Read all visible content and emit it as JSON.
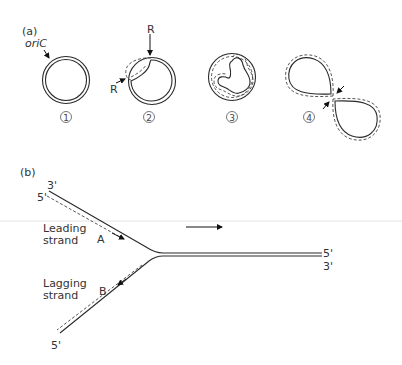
{
  "panel_a": {
    "label": "(a)",
    "origin_label": "oriC",
    "replication_fork_label_top": "R",
    "replication_fork_label_left": "R",
    "stages": [
      {
        "number": "1",
        "description": "circular chromosome with origin"
      },
      {
        "number": "2",
        "description": "theta replication bubble"
      },
      {
        "number": "3",
        "description": "replication nearly complete"
      },
      {
        "number": "4",
        "description": "two daughter circles separating"
      }
    ]
  },
  "panel_b": {
    "label": "(b)",
    "top_left_end_top": "3'",
    "top_left_end_bottom": "5'",
    "right_end_top": "5'",
    "right_end_bottom": "3'",
    "bottom_left_end": "5'",
    "leading_strand_label_line1": "Leading",
    "leading_strand_label_line2": "strand",
    "lagging_strand_label_line1": "Lagging",
    "lagging_strand_label_line2": "strand",
    "point_a": "A",
    "point_b": "B",
    "fork_direction": "right"
  }
}
